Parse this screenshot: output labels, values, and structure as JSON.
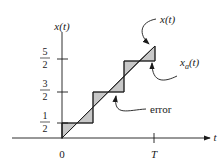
{
  "diagram": {
    "type": "quantization-staircase",
    "y_axis_label": "x(t)",
    "x_axis_label": "t",
    "origin_label": "0",
    "x_tick_label": "T",
    "y_ticks": [
      {
        "num": "1",
        "den": "2"
      },
      {
        "num": "3",
        "den": "2"
      },
      {
        "num": "5",
        "den": "2"
      }
    ],
    "annotations": {
      "signal": "x(t)",
      "approx_base": "x",
      "approx_sub": "a",
      "approx_tail": "(t)",
      "error": "error"
    },
    "colors": {
      "line": "#1a1a1a",
      "fill": "#c8c8c8",
      "background": "#ffffff"
    }
  }
}
